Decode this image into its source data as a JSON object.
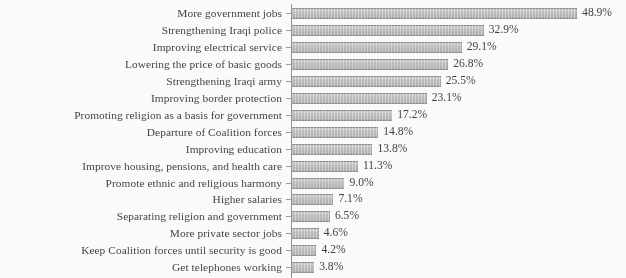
{
  "chart_data": {
    "type": "bar",
    "orientation": "horizontal",
    "title": "",
    "subtitle": "",
    "xlabel": "",
    "ylabel": "",
    "xlim": [
      0,
      48.9
    ],
    "grid": false,
    "legend": null,
    "value_suffix": "%",
    "categories": [
      "More government jobs",
      "Strengthening Iraqi police",
      "Improving electrical service",
      "Lowering the price of basic goods",
      "Strengthening Iraqi army",
      "Improving border protection",
      "Promoting religion as a basis for government",
      "Departure of Coalition forces",
      "Improving education",
      "Improve housing, pensions, and health care",
      "Promote ethnic and religious harmony",
      "Higher salaries",
      "Separating religion and government",
      "More private sector jobs",
      "Keep Coalition forces until security is good",
      "Get telephones working"
    ],
    "values": [
      48.9,
      32.9,
      29.1,
      26.8,
      25.5,
      23.1,
      17.2,
      14.8,
      13.8,
      11.3,
      9.0,
      7.1,
      6.5,
      4.6,
      4.2,
      3.8
    ],
    "value_labels": [
      "48.9%",
      "32.9%",
      "29.1%",
      "26.8%",
      "25.5%",
      "23.1%",
      "17.2%",
      "14.8%",
      "13.8%",
      "11.3%",
      "9.0%",
      "7.1%",
      "6.5%",
      "4.6%",
      "4.2%",
      "3.8%"
    ],
    "colors": {
      "bar_fill": "#c6c6c6",
      "bar_edge": "#8a8a8a",
      "text": "#3a3a3a",
      "axis": "#8e8e8e",
      "background": "#ffffff"
    }
  }
}
